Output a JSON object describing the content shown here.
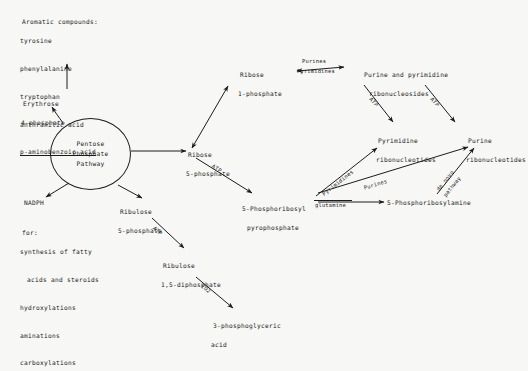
{
  "diagram": {
    "ink_color": "#1c1c1c",
    "background_color": "#f7f7f6"
  },
  "nodes": {
    "aromatic_header": "Aromatic compounds:",
    "aromatic_items": [
      "tyrosine",
      "phenylalanine",
      "tryptophan",
      "anthranilic acid",
      "p-aminobenzoic acid"
    ],
    "erythrose_l1": "Erythrose",
    "erythrose_l2": "4-phosphate",
    "pentose_l1": "Pentose",
    "pentose_l2": "Phosphate",
    "pentose_l3": "Pathway",
    "nadph": "NADPH",
    "for_header": "for:",
    "for_items": [
      "synthesis of fatty",
      "acids and steroids",
      "hydroxylations",
      "aminations",
      "carboxylations"
    ],
    "ribulose5p_l1": "Ribulose",
    "ribulose5p_l2": "5-phosphate",
    "ribose5p_l1": "Ribose",
    "ribose5p_l2": "5-phosphate",
    "ribose1p_l1": "Ribose",
    "ribose1p_l2": "1-phosphate",
    "prpp_l1": "5-Phosphoribosyl",
    "prpp_l2": "pyrophosphate",
    "rudp_l1": "Ribulose",
    "rudp_l2": "1,5-diphosphate",
    "pga_l1": "3-phosphoglyceric",
    "pga_l2": "acid",
    "nucleosides_l1": "Purine and pyrimidine",
    "nucleosides_l2": "ribonucleosides",
    "pyr_nucleotides_l1": "Pyrimidine",
    "pyr_nucleotides_l2": "ribonucleotides",
    "pur_nucleotides_l1": "Purine",
    "pur_nucleotides_l2": "ribonucleotides",
    "phosphoribosylamine": "5-Phosphoribosylamine"
  },
  "edge_labels": {
    "purines_top": "Purines",
    "pyrimidines_top": "Pyrimidines",
    "atp_r5p_prpp": "ATP",
    "atp_ru5p_rudp": "ATP",
    "atp_pyrimidine": "ATP",
    "atp_purine": "ATP",
    "co2": "CO2",
    "glutamine": "glutamine",
    "pyrimidines_diag": "Pyrimidines",
    "purines_diag": "Purines",
    "de_novo_1": "de novo",
    "de_novo_2": "pathway"
  }
}
